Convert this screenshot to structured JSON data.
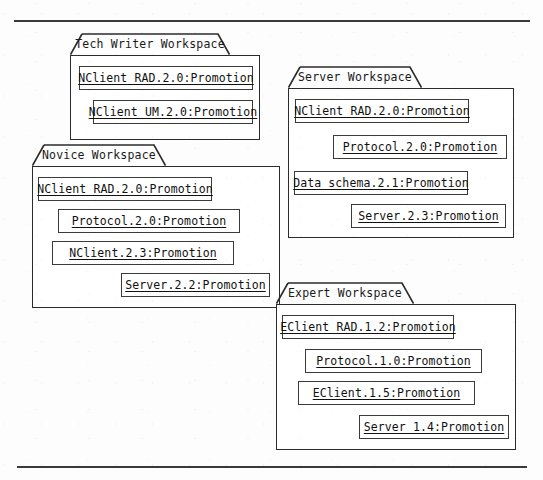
{
  "figure": {
    "kind": "uml-package-diagram",
    "background_color": "#fdfdfd",
    "line_color": "#2b2b2b",
    "rule_color": "#3a3a3a",
    "rules": [
      {
        "name": "top-rule",
        "x": 14,
        "y": 20,
        "width": 516
      },
      {
        "name": "bottom-rule",
        "x": 17,
        "y": 466,
        "width": 510
      }
    ]
  },
  "packages": [
    {
      "id": "tech-writer-workspace",
      "title": "Tech Writer Workspace",
      "tab": {
        "x": 70,
        "y": 33,
        "width": 160,
        "height": 22,
        "slant": 12
      },
      "body": {
        "x": 70,
        "y": 55,
        "width": 190,
        "height": 85
      },
      "items": [
        {
          "label": "NClient RAD.2.0:Promotion",
          "x": 8,
          "y": 10,
          "width": 174
        },
        {
          "label": "NClient UM.2.0:Promotion",
          "x": 22,
          "y": 44,
          "width": 160
        }
      ]
    },
    {
      "id": "server-workspace",
      "title": "Server Workspace",
      "tab": {
        "x": 288,
        "y": 66,
        "width": 134,
        "height": 22,
        "slant": 12
      },
      "body": {
        "x": 288,
        "y": 88,
        "width": 226,
        "height": 150
      },
      "items": [
        {
          "label": "NClient RAD.2.0:Promotion",
          "x": 6,
          "y": 10,
          "width": 174
        },
        {
          "label": "Protocol.2.0:Promotion",
          "x": 44,
          "y": 46,
          "width": 174
        },
        {
          "label": "Data schema.2.1:Promotion",
          "x": 5,
          "y": 82,
          "width": 174
        },
        {
          "label": "Server.2.3:Promotion",
          "x": 62,
          "y": 115,
          "width": 155
        }
      ]
    },
    {
      "id": "novice-workspace",
      "title": "Novice Workspace",
      "tab": {
        "x": 32,
        "y": 144,
        "width": 134,
        "height": 22,
        "slant": 12
      },
      "body": {
        "x": 32,
        "y": 166,
        "width": 248,
        "height": 142
      },
      "items": [
        {
          "label": "NClient RAD.2.0:Promotion",
          "x": 5,
          "y": 10,
          "width": 174
        },
        {
          "label": "Protocol.2.0:Promotion",
          "x": 25,
          "y": 42,
          "width": 182
        },
        {
          "label": "NClient.2.3:Promotion",
          "x": 19,
          "y": 74,
          "width": 182
        },
        {
          "label": "Server.2.2:Promotion",
          "x": 88,
          "y": 106,
          "width": 149
        }
      ]
    },
    {
      "id": "expert-workspace",
      "title": "Expert Workspace",
      "tab": {
        "x": 276,
        "y": 282,
        "width": 138,
        "height": 22,
        "slant": 12
      },
      "body": {
        "x": 276,
        "y": 304,
        "width": 240,
        "height": 146
      },
      "items": [
        {
          "label": "EClient RAD.1.2:Promotion",
          "x": 5,
          "y": 10,
          "width": 172
        },
        {
          "label": "Protocol.1.0:Promotion",
          "x": 28,
          "y": 44,
          "width": 177
        },
        {
          "label": "EClient.1.5:Promotion",
          "x": 21,
          "y": 76,
          "width": 177
        },
        {
          "label": "Server 1.4:Promotion",
          "x": 82,
          "y": 110,
          "width": 150
        }
      ]
    }
  ]
}
